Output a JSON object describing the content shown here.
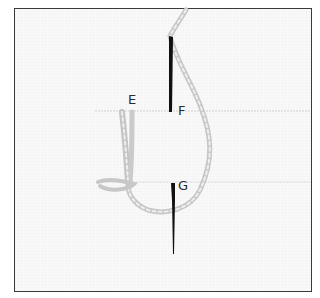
{
  "figure": {
    "labels": {
      "e": "E",
      "f": "F",
      "g": "G"
    },
    "colors": {
      "frame": "#3a3a3a",
      "fabric": "#f9f9f9",
      "thread": "#c8c8c8",
      "needle": "#111111",
      "guide_line": "#cfcfcf"
    }
  }
}
